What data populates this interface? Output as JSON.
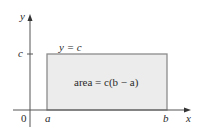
{
  "figure": {
    "axes": {
      "x_label": "x",
      "y_label": "y",
      "origin_label": "0"
    },
    "ticks": {
      "x": [
        "a",
        "b"
      ],
      "y": [
        "c"
      ]
    },
    "line_label": "y = c",
    "area_label": "area = c(b − a)",
    "colors": {
      "axis": "#555555",
      "rect_fill": "#ececec",
      "rect_stroke": "#8c8c8c",
      "text": "#2a2a2a"
    }
  }
}
